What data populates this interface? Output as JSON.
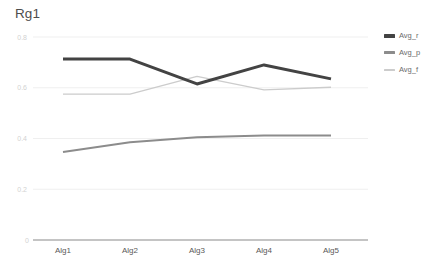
{
  "chart_data": {
    "type": "line",
    "title": "Rg1",
    "xlabel": "",
    "ylabel": "",
    "categories": [
      "Alg1",
      "Alg2",
      "Alg3",
      "Alg4",
      "Alg5"
    ],
    "ylim": [
      0,
      0.8
    ],
    "ytick_labels": [
      "0.8",
      "0.6",
      "0.4",
      "0.2",
      "0"
    ],
    "ytick_values": [
      0.8,
      0.6,
      0.4,
      0.2,
      0
    ],
    "grid": true,
    "legend_position": "right",
    "series": [
      {
        "name": "Avg_r",
        "color": "#434343",
        "line_width": 3,
        "values": [
          0.713,
          0.713,
          0.615,
          0.69,
          0.635
        ]
      },
      {
        "name": "Avg_p",
        "color": "#8c8c8c",
        "line_width": 2,
        "values": [
          0.347,
          0.385,
          0.405,
          0.412,
          0.412
        ]
      },
      {
        "name": "Avg_f",
        "color": "#cccccc",
        "line_width": 1.3,
        "values": [
          0.575,
          0.575,
          0.645,
          0.592,
          0.602
        ]
      }
    ]
  },
  "legend": {
    "items": [
      {
        "label": "Avg_r",
        "color": "#434343",
        "thickness": "4px"
      },
      {
        "label": "Avg_p",
        "color": "#8c8c8c",
        "thickness": "3px"
      },
      {
        "label": "Avg_f",
        "color": "#cccccc",
        "thickness": "2px"
      }
    ]
  },
  "colors": {
    "gridline": "#e8e8e8",
    "axis": "#8a8a8a",
    "ytick_text": "#d2d2d2",
    "xtick_text": "#595959",
    "title_text": "#4d4d4d",
    "background": "#ffffff"
  }
}
